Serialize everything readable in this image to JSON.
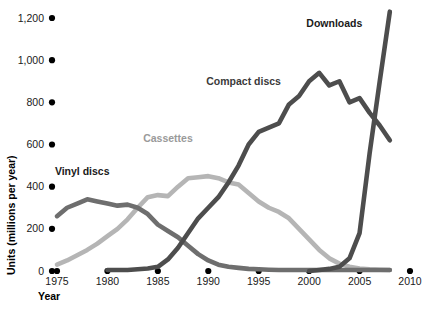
{
  "chart_data": {
    "type": "line",
    "title": "",
    "xlabel": "Year",
    "ylabel": "Units (millions per year)",
    "xlim": [
      1975,
      2010
    ],
    "ylim": [
      0,
      1200
    ],
    "grid": false,
    "legend_position": "inline-annotations",
    "x_ticks": [
      "1975",
      "1980",
      "1985",
      "1990",
      "1995",
      "2000",
      "2005",
      "2010"
    ],
    "y_ticks": [
      "0",
      "200",
      "400",
      "600",
      "800",
      "1,000",
      "1,200"
    ],
    "series": [
      {
        "name": "Vinyl discs",
        "color": "#6e6e6e",
        "label": "Vinyl discs",
        "x": [
          1975,
          1976,
          1977,
          1978,
          1979,
          1980,
          1981,
          1982,
          1983,
          1984,
          1985,
          1986,
          1987,
          1988,
          1989,
          1990,
          1991,
          1992,
          1993,
          1994,
          1995,
          1996,
          1997,
          1998,
          1999,
          2000,
          2001,
          2002,
          2003,
          2004,
          2005,
          2006,
          2007,
          2008
        ],
        "values": [
          260,
          300,
          320,
          340,
          330,
          320,
          310,
          315,
          300,
          270,
          220,
          190,
          160,
          120,
          80,
          50,
          30,
          20,
          15,
          10,
          8,
          6,
          5,
          5,
          5,
          5,
          5,
          5,
          5,
          5,
          5,
          5,
          5,
          5
        ]
      },
      {
        "name": "Cassettes",
        "color": "#b5b5b5",
        "label": "Cassettes",
        "x": [
          1975,
          1976,
          1977,
          1978,
          1979,
          1980,
          1981,
          1982,
          1983,
          1984,
          1985,
          1986,
          1987,
          1988,
          1989,
          1990,
          1991,
          1992,
          1993,
          1994,
          1995,
          1996,
          1997,
          1998,
          1999,
          2000,
          2001,
          2002,
          2003,
          2004,
          2005,
          2006,
          2007,
          2008
        ],
        "values": [
          30,
          50,
          75,
          100,
          130,
          165,
          200,
          245,
          300,
          350,
          360,
          355,
          400,
          440,
          445,
          450,
          440,
          420,
          410,
          370,
          330,
          300,
          280,
          250,
          200,
          150,
          100,
          60,
          35,
          20,
          12,
          8,
          6,
          5
        ]
      },
      {
        "name": "Compact discs",
        "color": "#4d4d4d",
        "label": "Compact discs",
        "x": [
          1980,
          1981,
          1982,
          1983,
          1984,
          1985,
          1986,
          1987,
          1988,
          1989,
          1990,
          1991,
          1992,
          1993,
          1994,
          1995,
          1996,
          1997,
          1998,
          1999,
          2000,
          2001,
          2002,
          2003,
          2004,
          2005,
          2006,
          2007,
          2008
        ],
        "values": [
          5,
          5,
          5,
          8,
          12,
          20,
          55,
          110,
          180,
          250,
          300,
          350,
          420,
          500,
          600,
          660,
          680,
          700,
          790,
          830,
          900,
          940,
          880,
          900,
          800,
          820,
          750,
          690,
          620
        ]
      },
      {
        "name": "Downloads",
        "color": "#4d4d4d",
        "label": "Downloads",
        "x": [
          2000,
          2001,
          2002,
          2003,
          2004,
          2005,
          2006,
          2007,
          2008
        ],
        "values": [
          0,
          5,
          10,
          20,
          60,
          180,
          560,
          900,
          1230
        ]
      }
    ],
    "annotations": [
      {
        "text": "Vinyl discs",
        "x": 1977.5,
        "y": 455,
        "color": "#1a1a1a"
      },
      {
        "text": "Cassettes",
        "x": 1986.0,
        "y": 610,
        "color": "#9a9a9a"
      },
      {
        "text": "Compact discs",
        "x": 1993.5,
        "y": 880,
        "color": "#3a3a3a"
      },
      {
        "text": "Downloads",
        "x": 2002.5,
        "y": 1155,
        "color": "#1a1a1a"
      }
    ]
  }
}
